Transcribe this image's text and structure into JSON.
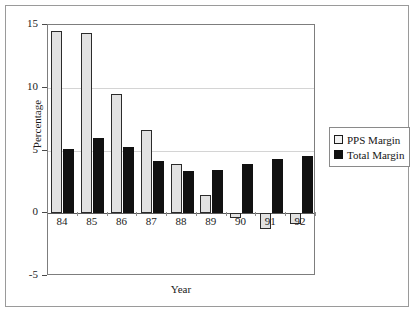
{
  "chart_data": {
    "type": "bar",
    "title": "",
    "subtitle": "",
    "xlabel": "Year",
    "ylabel": "Percentage",
    "categories": [
      "84",
      "85",
      "86",
      "87",
      "88",
      "89",
      "90",
      "91",
      "92"
    ],
    "series": [
      {
        "name": "PPS Margin",
        "color": "#e2e2e2",
        "values": [
          14.5,
          14.4,
          9.5,
          6.6,
          3.9,
          1.45,
          -0.4,
          -1.25,
          -0.85
        ]
      },
      {
        "name": "Total Margin",
        "color": "#111111",
        "values": [
          5.1,
          6.0,
          5.3,
          4.2,
          3.35,
          3.45,
          3.9,
          4.3,
          4.6
        ]
      }
    ],
    "ylim": [
      -5,
      15
    ],
    "yticks": [
      -5,
      0,
      5,
      10,
      15
    ],
    "ytick_labels": [
      "-5",
      "0",
      "5",
      "10",
      "15"
    ],
    "grid": true,
    "grid_axis": "y",
    "legend_position": "right"
  },
  "legend": {
    "entries": [
      {
        "label": "PPS Margin",
        "swatch": "pps"
      },
      {
        "label": "Total Margin",
        "swatch": "total"
      }
    ]
  }
}
